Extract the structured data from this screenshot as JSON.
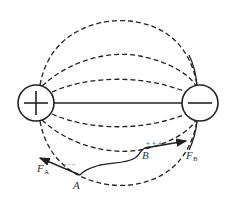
{
  "diagram": {
    "charges": {
      "positive": {
        "symbol": "+",
        "cx": 36,
        "cy": 103,
        "r": 18
      },
      "negative": {
        "symbol": "−",
        "cx": 200,
        "cy": 103,
        "r": 18
      }
    },
    "labels": {
      "point_a": "A",
      "point_b": "B",
      "force_a": "F",
      "force_a_sub": "A",
      "force_b": "F",
      "force_b_sub": "B",
      "plus_signs": "+ + +",
      "minus_signs": "- - -"
    },
    "colors": {
      "stroke": "#222222",
      "background": "#ffffff"
    }
  }
}
